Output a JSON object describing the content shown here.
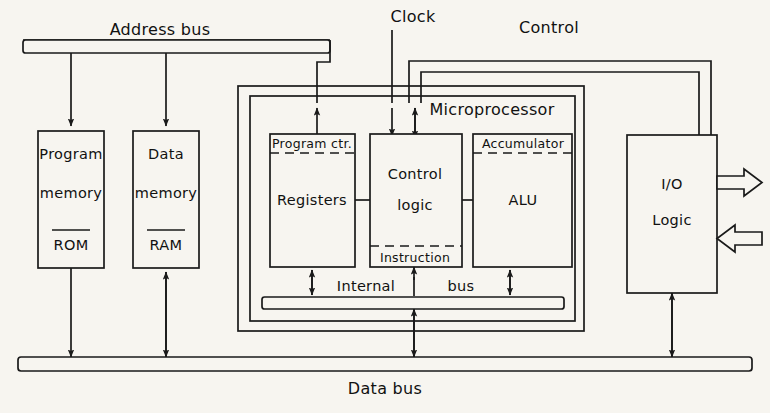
{
  "diagram": {
    "background_color": "#f7f5f0",
    "line_color": "#1a1a1a"
  },
  "buses": {
    "address_bus": {
      "label": "Address bus",
      "orientation": "horizontal",
      "position": "top"
    },
    "data_bus": {
      "label": "Data bus",
      "orientation": "horizontal",
      "position": "bottom"
    },
    "internal_bus": {
      "label_part_1": "Internal",
      "label_part_2": "bus",
      "orientation": "horizontal",
      "position": "inside-microprocessor"
    },
    "clock": {
      "label": "Clock",
      "type": "single-line",
      "direction": "into-control-logic"
    },
    "control": {
      "label": "Control",
      "type": "double-line",
      "direction": "bidirectional"
    }
  },
  "blocks": {
    "program_memory": {
      "line1": "Program",
      "line2": "memory",
      "line3": "ROM"
    },
    "data_memory": {
      "line1": "Data",
      "line2": "memory",
      "line3": "RAM"
    },
    "microprocessor": {
      "label": "Microprocessor",
      "registers": {
        "header": "Program ctr.",
        "body": "Registers"
      },
      "control_logic": {
        "line1": "Control",
        "line2": "logic",
        "footer": "Instruction"
      },
      "alu": {
        "header": "Accumulator",
        "body": "ALU"
      }
    },
    "io_logic": {
      "line1": "I/O",
      "line2": "Logic"
    }
  },
  "io_ports": {
    "output_arrow": "output-port-arrow",
    "input_arrow": "input-port-arrow"
  },
  "icons": {
    "arrow_down": "arrow-down-icon",
    "arrow_up": "arrow-up-icon",
    "arrow_bidirectional": "arrow-bidirectional-icon",
    "block_arrow_right": "block-arrow-right-icon",
    "block_arrow_left": "block-arrow-left-icon"
  }
}
